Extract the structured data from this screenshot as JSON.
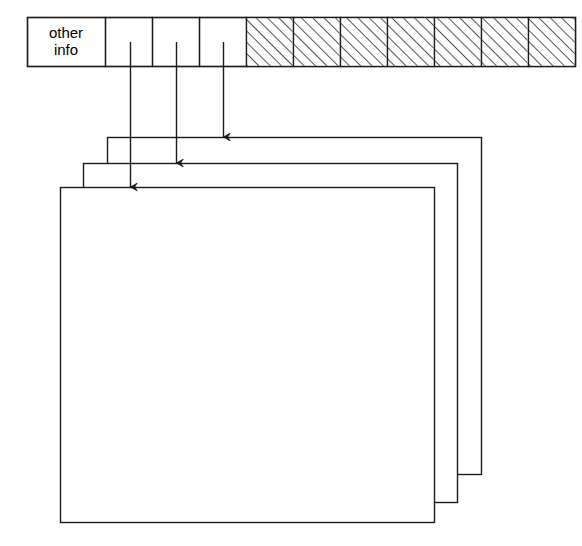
{
  "diagram": {
    "title": "",
    "type": "inode-block-pointer-diagram",
    "colors": {
      "stroke": "#1a1a1a",
      "fill": "#ffffff",
      "hatch": "#2b2b2b",
      "text": "#000000"
    },
    "header_row": {
      "name": "inode-header-row",
      "x": 27,
      "y": 17,
      "width": 548,
      "height": 49,
      "cells": [
        {
          "id": "other-info",
          "label_line1": "other",
          "label_line2": "info",
          "x": 27,
          "width": 78,
          "hatched": false
        },
        {
          "id": "pointer-1",
          "label": "",
          "x": 105,
          "width": 47,
          "hatched": false
        },
        {
          "id": "pointer-2",
          "label": "",
          "x": 152,
          "width": 47,
          "hatched": false
        },
        {
          "id": "pointer-3",
          "label": "",
          "x": 199,
          "width": 47,
          "hatched": false
        },
        {
          "id": "unused-1",
          "label": "",
          "x": 246,
          "width": 47,
          "hatched": true
        },
        {
          "id": "unused-2",
          "label": "",
          "x": 293,
          "width": 47,
          "hatched": true
        },
        {
          "id": "unused-3",
          "label": "",
          "x": 340,
          "width": 47,
          "hatched": true
        },
        {
          "id": "unused-4",
          "label": "",
          "x": 387,
          "width": 47,
          "hatched": true
        },
        {
          "id": "unused-5",
          "label": "",
          "x": 434,
          "width": 47,
          "hatched": true
        },
        {
          "id": "unused-6",
          "label": "",
          "x": 481,
          "width": 47,
          "hatched": true
        },
        {
          "id": "unused-7",
          "label": "",
          "x": 528,
          "width": 47,
          "hatched": true
        }
      ]
    },
    "arrows": [
      {
        "id": "arrow-to-page-3",
        "x": 223,
        "y_start": 42,
        "y_end": 137,
        "target": "page-back"
      },
      {
        "id": "arrow-to-page-2",
        "x": 176,
        "y_start": 42,
        "y_end": 163,
        "target": "page-middle"
      },
      {
        "id": "arrow-to-page-1",
        "x": 130,
        "y_start": 42,
        "y_end": 187,
        "target": "page-front"
      }
    ],
    "pages": [
      {
        "id": "page-back",
        "label": "",
        "x": 107,
        "y": 137,
        "width": 374,
        "height": 337,
        "z": 1
      },
      {
        "id": "page-middle",
        "label": "",
        "x": 83,
        "y": 163,
        "width": 374,
        "height": 339,
        "z": 2
      },
      {
        "id": "page-front",
        "label": "",
        "x": 60,
        "y": 187,
        "width": 374,
        "height": 335,
        "z": 3
      }
    ]
  }
}
